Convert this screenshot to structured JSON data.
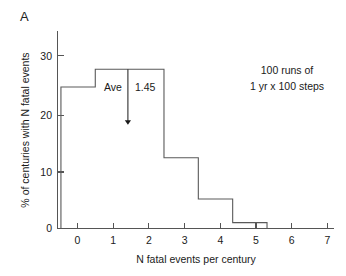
{
  "panel": {
    "label": "A"
  },
  "chart_data": {
    "type": "bar",
    "title": "",
    "subtitle": "",
    "xlabel": "N fatal events per century",
    "ylabel": "% of centuries with N fatal events",
    "categories": [
      "0",
      "1",
      "2",
      "3",
      "4",
      "5"
    ],
    "x": [
      0,
      1,
      2,
      3,
      4,
      5
    ],
    "values": [
      24,
      27,
      27,
      12,
      5,
      1
    ],
    "bin_width": 1,
    "bin_edges": [
      -0.5,
      0.5,
      1.5,
      2.5,
      3.5,
      4.5,
      5.5
    ],
    "xlim": [
      -0.6,
      7.45
    ],
    "ylim": [
      0,
      33.5
    ],
    "xticks": [
      0,
      1,
      2,
      3,
      4,
      5,
      6,
      7
    ],
    "xtick_labels": [
      "0",
      "1",
      "2",
      "3",
      "4",
      "5",
      "6",
      "7"
    ],
    "yticks": [
      0,
      10,
      20,
      30
    ],
    "ytick_labels": [
      "0",
      "10",
      "20",
      "30"
    ],
    "grid": false,
    "legend": false,
    "legend_position": "none",
    "series": [
      {
        "name": "% of centuries with N fatal events",
        "values": [
          24,
          27,
          27,
          12,
          5,
          1
        ]
      }
    ],
    "annotations": [
      {
        "name": "average-marker",
        "label": "Ave",
        "value_label": "1.45",
        "value": 1.45,
        "type": "down-arrow"
      },
      {
        "name": "run-note",
        "line1": "100 runs of",
        "line2": "1 yr x 100 steps"
      }
    ]
  },
  "colors": {
    "background": "#ffffff",
    "axis": "#555555",
    "histogram_outline": "#5a5a5a",
    "text": "#1a1a1a"
  }
}
